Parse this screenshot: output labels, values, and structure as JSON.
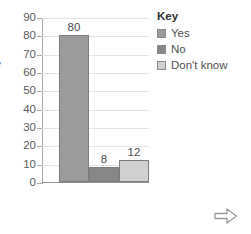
{
  "chart_data": {
    "type": "bar",
    "title": "",
    "subtitle": "",
    "xlabel": "",
    "ylabel": "e",
    "categories": [
      "Yes",
      "No",
      "Don't know"
    ],
    "values": [
      80,
      8,
      12
    ],
    "data_labels": [
      "80",
      "8",
      "12"
    ],
    "ylim": [
      0,
      90
    ],
    "ytick_step": 10,
    "yticks": [
      "90",
      "80",
      "70",
      "60",
      "50",
      "40",
      "30",
      "20",
      "10",
      "0"
    ],
    "xtick_labels": [],
    "grid": true,
    "legend_position": "top-right",
    "series_colors": [
      "#9b9b9b",
      "#878787",
      "#d0d0d0"
    ]
  },
  "legend": {
    "title": "Key",
    "entries": [
      {
        "label": "Yes",
        "color": "#9b9b9b"
      },
      {
        "label": "No",
        "color": "#878787"
      },
      {
        "label": "Don't know",
        "color": "#d0d0d0"
      }
    ]
  },
  "axis_title_clipped": "e",
  "arrow_glyph": "right-arrow-outline"
}
